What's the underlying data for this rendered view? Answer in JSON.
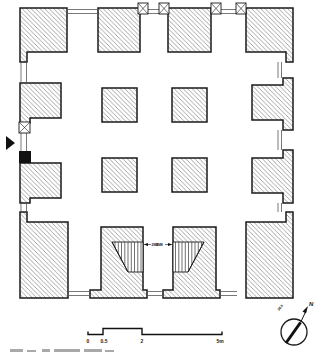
{
  "figure": {
    "type": "architectural floor plan"
  },
  "annotations": {
    "stair_left_label": "2M8",
    "stair_right_label": "2M8"
  },
  "scale_bar": {
    "ticks": [
      "0",
      "0.5",
      "2",
      "5m"
    ]
  },
  "compass": {
    "north": "N",
    "declination": "38.9"
  },
  "colors": {
    "ink": "#1a1a1a",
    "hatch": "#6a6a6a",
    "paper": "#ffffff"
  }
}
